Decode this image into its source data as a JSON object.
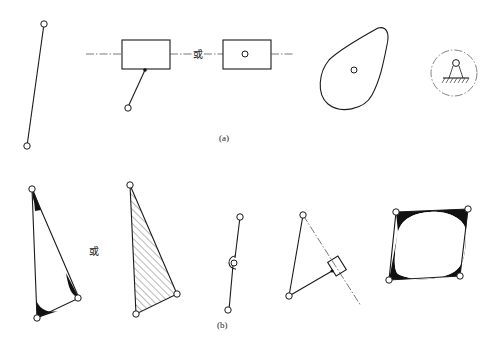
{
  "figure": {
    "row_a": {
      "caption": "(a)",
      "or_text": "或",
      "elements": [
        {
          "name": "binary-link",
          "description": "two-pin bar"
        },
        {
          "name": "slider-with-link",
          "description": "slider block on dash-dot guide with attached link"
        },
        {
          "name": "slider-with-pin",
          "description": "slider block with pin on guide"
        },
        {
          "name": "cam",
          "description": "pear-shaped cam disk with pivot"
        },
        {
          "name": "fixed-support",
          "description": "ground pivot within dashed circle"
        }
      ]
    },
    "row_b": {
      "caption": "(b)",
      "or_text": "或",
      "elements": [
        {
          "name": "ternary-link-filled-corners",
          "description": "triangular link with blackened corners"
        },
        {
          "name": "ternary-link-hatched",
          "description": "hatched triangle link"
        },
        {
          "name": "link-with-middle-joint",
          "description": "bar with intermediate joint"
        },
        {
          "name": "link-with-slider",
          "description": "triangle with slider on dash-dot guide"
        },
        {
          "name": "quaternary-link",
          "description": "four-pin link with filled corners"
        }
      ]
    }
  }
}
